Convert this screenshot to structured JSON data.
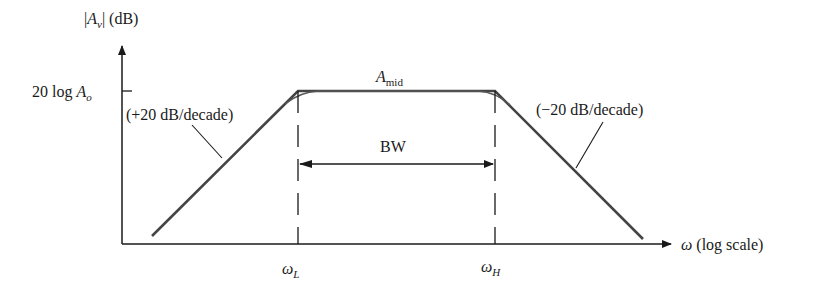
{
  "diagram": {
    "type": "bode-magnitude-plot",
    "y_axis_label": {
      "open": "|",
      "var": "A",
      "sub": "v",
      "close": "| (dB)"
    },
    "x_axis_label": {
      "var": "ω",
      "rest": " (log scale)"
    },
    "y_tick_label": {
      "prefix": "20 log ",
      "var": "A",
      "sub": "o"
    },
    "mid_label": {
      "var": "A",
      "sub": "mid"
    },
    "left_slope_label": "(+20 dB/decade)",
    "right_slope_label": "(−20 dB/decade)",
    "bandwidth_label": "BW",
    "lower_cutoff_label": {
      "var": "ω",
      "sub": "L"
    },
    "upper_cutoff_label": {
      "var": "ω",
      "sub": "H"
    },
    "colors": {
      "line": "#333333",
      "text": "#1a1a1a"
    }
  }
}
